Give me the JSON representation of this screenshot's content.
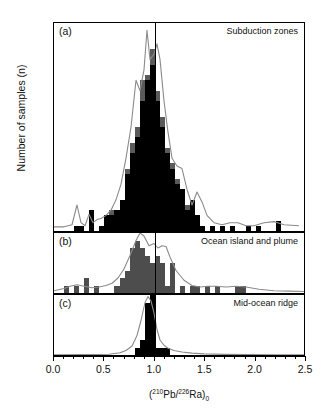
{
  "figure": {
    "ylabel": "Number of samples (n)",
    "xlabel_prefix": "(",
    "xlabel_sup1": "210",
    "xlabel_iso1": "Pb/",
    "xlabel_sup2": "226",
    "xlabel_iso2": "Ra",
    "xlabel_suffix": ")",
    "xlabel_sub": "0",
    "reference_value": "1.0"
  },
  "panels": [
    {
      "tag": "(a)",
      "title": "Subduction zones",
      "ymax": 40,
      "yticks": [
        0,
        10,
        20,
        30,
        40
      ]
    },
    {
      "tag": "(b)",
      "title": "Ocean island and plume",
      "ymax": 8,
      "yticks": [
        0,
        8
      ]
    },
    {
      "tag": "(c)",
      "title": "Mid-ocean ridge",
      "ymax": 8,
      "yticks": [
        0,
        8
      ]
    }
  ],
  "xaxis": {
    "min": 0.0,
    "max": 2.5,
    "major_ticks": [
      0.0,
      0.5,
      1.0,
      1.5,
      2.0,
      2.5
    ],
    "tick_labels": [
      "0.0",
      "0.5",
      "1.0",
      "1.5",
      "2.0",
      "2.5"
    ],
    "minor_step": 0.1
  },
  "colors": {
    "bar_dark": "#000000",
    "bar_mid": "#5a5a5a",
    "bar_gray": "#4d4d4d",
    "curve": "#8a8a8a",
    "axis": "#000000"
  },
  "chart_data": {
    "type": "bar",
    "xlabel": "(210Pb/226Ra)0",
    "ylabel": "Number of samples (n)",
    "bin_width": 0.05,
    "grid": false,
    "legend": "none",
    "annotations": [
      {
        "type": "vline",
        "x": 1.0,
        "label": "secular equilibrium"
      }
    ],
    "panels": [
      {
        "tag": "(a)",
        "name": "Subduction zones",
        "ylim": [
          0,
          40
        ],
        "xlim": [
          0.0,
          2.5
        ],
        "bin_centers": [
          0.225,
          0.275,
          0.325,
          0.375,
          0.425,
          0.475,
          0.525,
          0.575,
          0.625,
          0.675,
          0.725,
          0.775,
          0.825,
          0.875,
          0.925,
          0.975,
          1.025,
          1.075,
          1.125,
          1.175,
          1.225,
          1.275,
          1.325,
          1.375,
          1.425,
          1.475,
          1.525,
          1.575,
          1.625,
          1.675,
          1.725,
          1.775,
          1.825,
          1.875,
          1.925,
          1.975,
          2.025,
          2.075,
          2.125,
          2.175,
          2.225
        ],
        "series": [
          {
            "name": "lower (black)",
            "values": [
              1,
              1,
              0,
              4,
              0,
              1,
              3,
              3,
              4,
              6,
              11,
              15,
              18,
              25,
              29,
              32,
              25,
              20,
              15,
              12,
              9,
              8,
              4,
              6,
              3,
              1,
              0,
              1,
              0,
              1,
              0,
              1,
              0,
              0,
              1,
              0,
              1,
              0,
              0,
              0,
              2
            ]
          },
          {
            "name": "upper (gray)",
            "values": [
              0,
              0,
              0,
              0,
              0,
              0,
              0,
              1,
              0,
              0,
              1,
              2,
              2,
              4,
              1,
              3,
              2,
              2,
              1,
              1,
              1,
              0,
              1,
              0,
              0,
              0,
              0,
              0,
              0,
              0,
              0,
              0,
              0,
              0,
              0,
              0,
              0,
              0,
              0,
              0,
              0
            ]
          }
        ],
        "density_curve": {
          "x": [
            0.0,
            0.1,
            0.18,
            0.23,
            0.27,
            0.31,
            0.35,
            0.39,
            0.43,
            0.47,
            0.52,
            0.57,
            0.62,
            0.67,
            0.72,
            0.77,
            0.82,
            0.86,
            0.9,
            0.93,
            0.96,
            1.0,
            1.03,
            1.06,
            1.1,
            1.14,
            1.18,
            1.23,
            1.28,
            1.33,
            1.38,
            1.43,
            1.48,
            1.53,
            1.6,
            1.68,
            1.76,
            1.84,
            1.92,
            2.0,
            2.1,
            2.2,
            2.3,
            2.45
          ],
          "y": [
            0.8,
            0.8,
            1.2,
            5.0,
            1.6,
            1.0,
            3.2,
            1.6,
            2.2,
            2.4,
            3.0,
            4.0,
            6.0,
            9.0,
            14.0,
            20.0,
            29.0,
            27.0,
            31.0,
            38.6,
            33.0,
            34.0,
            36.0,
            33.0,
            25.0,
            19.0,
            14.0,
            12.5,
            12.0,
            8.0,
            5.0,
            7.5,
            5.6,
            3.0,
            1.6,
            1.2,
            1.6,
            1.6,
            1.0,
            1.0,
            1.6,
            1.8,
            1.2,
            1.0
          ]
        }
      },
      {
        "tag": "(b)",
        "name": "Ocean island and plume",
        "ylim": [
          0,
          8
        ],
        "xlim": [
          0.0,
          2.5
        ],
        "bin_centers": [
          0.125,
          0.225,
          0.275,
          0.325,
          0.425,
          0.625,
          0.675,
          0.725,
          0.775,
          0.825,
          0.875,
          0.925,
          0.975,
          1.025,
          1.075,
          1.125,
          1.175,
          1.275,
          1.375,
          1.425,
          1.525,
          1.625,
          1.825,
          1.875
        ],
        "series": [
          {
            "name": "samples",
            "values": [
              1,
              1,
              0,
              2,
              1,
              1,
              2,
              3,
              6,
              7,
              6,
              5,
              4,
              5,
              4,
              1,
              4,
              1,
              1,
              1,
              1,
              1,
              1,
              1
            ]
          }
        ],
        "density_curve": {
          "x": [
            0.0,
            0.1,
            0.16,
            0.23,
            0.3,
            0.38,
            0.45,
            0.52,
            0.58,
            0.64,
            0.7,
            0.76,
            0.82,
            0.86,
            0.9,
            0.95,
            1.0,
            1.04,
            1.08,
            1.12,
            1.16,
            1.22,
            1.3,
            1.38,
            1.46,
            1.54,
            1.62,
            1.72,
            1.82,
            1.92,
            2.05,
            2.2,
            2.35,
            2.5
          ],
          "y": [
            0.3,
            0.6,
            0.9,
            1.1,
            0.9,
            0.7,
            0.8,
            1.0,
            1.3,
            2.0,
            3.2,
            5.0,
            7.0,
            8.0,
            7.6,
            6.3,
            6.6,
            6.0,
            6.3,
            6.2,
            4.8,
            3.0,
            1.7,
            1.0,
            0.8,
            0.9,
            0.9,
            0.8,
            0.9,
            0.8,
            0.5,
            0.3,
            0.25,
            0.2
          ]
        }
      },
      {
        "tag": "(c)",
        "name": "Mid-ocean ridge",
        "ylim": [
          0,
          8
        ],
        "xlim": [
          0.0,
          2.5
        ],
        "bin_centers": [
          0.825,
          0.875,
          0.925,
          0.975,
          1.025,
          1.075,
          1.125
        ],
        "series": [
          {
            "name": "samples",
            "values": [
              1,
              2,
              7,
              8,
              1,
              1,
              1
            ]
          }
        ],
        "density_curve": {
          "x": [
            0.0,
            0.3,
            0.55,
            0.66,
            0.72,
            0.78,
            0.83,
            0.87,
            0.91,
            0.94,
            0.97,
            1.0,
            1.03,
            1.06,
            1.1,
            1.14,
            1.2,
            1.28,
            1.38,
            1.5,
            1.7,
            1.95,
            2.2,
            2.5
          ],
          "y": [
            0.03,
            0.05,
            0.1,
            0.3,
            0.6,
            1.2,
            2.6,
            4.6,
            7.0,
            7.8,
            7.2,
            5.6,
            3.4,
            2.0,
            1.3,
            0.9,
            0.6,
            0.4,
            0.25,
            0.15,
            0.08,
            0.05,
            0.04,
            0.03
          ]
        }
      }
    ]
  }
}
